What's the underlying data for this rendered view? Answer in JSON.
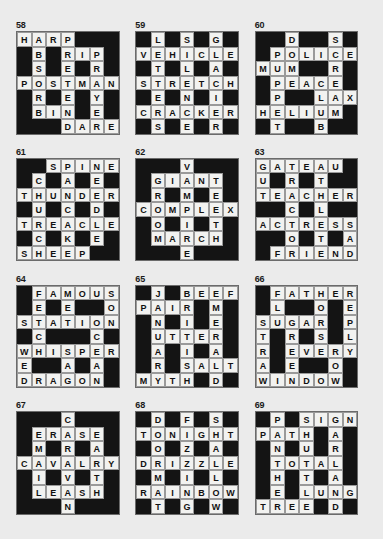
{
  "page": {
    "background_color": "#ebebeb",
    "block_color": "#141414",
    "cell_color": "#f2f2f0",
    "text_color": "#111111",
    "grid_size": 7,
    "puzzle_count": 12
  },
  "puzzles": [
    {
      "number": "58",
      "rows": [
        [
          "H",
          "A",
          "R",
          "P",
          "#",
          "#",
          "#"
        ],
        [
          "#",
          "B",
          "#",
          "R",
          "I",
          "P",
          "#"
        ],
        [
          "#",
          "S",
          "#",
          "E",
          "#",
          "R",
          "#"
        ],
        [
          "P",
          "O",
          "S",
          "T",
          "M",
          "A",
          "N"
        ],
        [
          "#",
          "R",
          "#",
          "E",
          "#",
          "Y",
          "#"
        ],
        [
          "#",
          "B",
          "I",
          "N",
          "#",
          "E",
          "#"
        ],
        [
          "#",
          "#",
          "#",
          "D",
          "A",
          "R",
          "E"
        ]
      ],
      "words": [
        "HARP",
        "RIP",
        "POSTMAN",
        "BIN",
        "DARE",
        "HOSTER",
        "PRETEND",
        "PIRAYE",
        "BSORBINE"
      ]
    },
    {
      "number": "59",
      "rows": [
        [
          "#",
          "L",
          "#",
          "S",
          "#",
          "G",
          "#"
        ],
        [
          "V",
          "E",
          "H",
          "I",
          "C",
          "L",
          "E"
        ],
        [
          "#",
          "T",
          "#",
          "L",
          "#",
          "A",
          "#"
        ],
        [
          "S",
          "T",
          "R",
          "E",
          "T",
          "C",
          "H"
        ],
        [
          "#",
          "E",
          "#",
          "N",
          "#",
          "I",
          "#"
        ],
        [
          "C",
          "R",
          "A",
          "C",
          "K",
          "E",
          "R"
        ],
        [
          "#",
          "S",
          "#",
          "E",
          "#",
          "R",
          "#"
        ]
      ],
      "words": [
        "VEHICLE",
        "STRETCH",
        "CRACKER",
        "LETTERS",
        "SILENCE",
        "GLACIER"
      ]
    },
    {
      "number": "60",
      "rows": [
        [
          "#",
          "#",
          "D",
          "#",
          "#",
          "S",
          "#"
        ],
        [
          "#",
          "P",
          "O",
          "L",
          "I",
          "C",
          "E"
        ],
        [
          "M",
          "U",
          "M",
          "#",
          "#",
          "R",
          "#"
        ],
        [
          "#",
          "P",
          "E",
          "A",
          "C",
          "E",
          "#"
        ],
        [
          "#",
          "P",
          "#",
          "#",
          "L",
          "A",
          "X"
        ],
        [
          "H",
          "E",
          "L",
          "I",
          "U",
          "M",
          "#"
        ],
        [
          "#",
          "T",
          "#",
          "#",
          "B",
          "#",
          "#"
        ]
      ],
      "words": [
        "POLICE",
        "MUM",
        "PEACE",
        "LAX",
        "HELIUM",
        "DOME",
        "PUPPET",
        "SCREAM",
        "CLUB"
      ]
    },
    {
      "number": "61",
      "rows": [
        [
          "#",
          "#",
          "S",
          "P",
          "I",
          "N",
          "E"
        ],
        [
          "#",
          "C",
          "#",
          "A",
          "#",
          "E",
          "#"
        ],
        [
          "T",
          "H",
          "U",
          "N",
          "D",
          "E",
          "R"
        ],
        [
          "#",
          "U",
          "#",
          "C",
          "#",
          "D",
          "#"
        ],
        [
          "T",
          "R",
          "E",
          "A",
          "C",
          "L",
          "E"
        ],
        [
          "#",
          "C",
          "#",
          "K",
          "#",
          "E",
          "#"
        ],
        [
          "S",
          "H",
          "E",
          "E",
          "P",
          "#",
          "#"
        ]
      ],
      "words": [
        "SPINE",
        "THUNDER",
        "TREACLE",
        "SHEEP",
        "CHURCH",
        "SUE",
        "PANCAKE",
        "NEEDLE"
      ]
    },
    {
      "number": "62",
      "rows": [
        [
          "#",
          "#",
          "#",
          "V",
          "#",
          "#",
          "#"
        ],
        [
          "#",
          "G",
          "I",
          "A",
          "N",
          "T",
          "#"
        ],
        [
          "#",
          "R",
          "#",
          "M",
          "#",
          "E",
          "#"
        ],
        [
          "C",
          "O",
          "M",
          "P",
          "L",
          "E",
          "X"
        ],
        [
          "#",
          "O",
          "#",
          "I",
          "#",
          "T",
          "#"
        ],
        [
          "#",
          "M",
          "A",
          "R",
          "C",
          "H",
          "#"
        ],
        [
          "#",
          "#",
          "#",
          "E",
          "#",
          "#",
          "#"
        ]
      ],
      "words": [
        "GIANT",
        "COMPLEX",
        "MARCH",
        "GROOM",
        "VAMPIRE",
        "TEETH"
      ]
    },
    {
      "number": "63",
      "rows": [
        [
          "G",
          "A",
          "T",
          "E",
          "A",
          "U",
          "#"
        ],
        [
          "U",
          "#",
          "R",
          "#",
          "T",
          "#",
          "#"
        ],
        [
          "T",
          "E",
          "A",
          "C",
          "H",
          "E",
          "R"
        ],
        [
          "#",
          "#",
          "C",
          "#",
          "L",
          "#",
          "#"
        ],
        [
          "A",
          "C",
          "T",
          "R",
          "E",
          "S",
          "S"
        ],
        [
          "#",
          "#",
          "O",
          "#",
          "T",
          "#",
          "A"
        ],
        [
          "#",
          "F",
          "R",
          "I",
          "E",
          "N",
          "D"
        ]
      ],
      "words": [
        "GATEAU",
        "TEACHER",
        "ACTRESS",
        "FRIEND",
        "GUT",
        "TRACTOR",
        "ATHLETE",
        "SAD"
      ]
    },
    {
      "number": "64",
      "rows": [
        [
          "#",
          "F",
          "A",
          "M",
          "O",
          "U",
          "S"
        ],
        [
          "#",
          "E",
          "#",
          "E",
          "#",
          "#",
          "O"
        ],
        [
          "S",
          "T",
          "A",
          "T",
          "I",
          "O",
          "N"
        ],
        [
          "#",
          "C",
          "#",
          "#",
          "#",
          "C",
          "#"
        ],
        [
          "W",
          "H",
          "I",
          "S",
          "P",
          "E",
          "R"
        ],
        [
          "E",
          "#",
          "#",
          "A",
          "#",
          "A",
          "#"
        ],
        [
          "D",
          "R",
          "A",
          "G",
          "O",
          "N",
          "#"
        ]
      ],
      "words": [
        "FAMOUS",
        "STATION",
        "WHISPER",
        "DRAGON",
        "FETCH",
        "SWED",
        "SON",
        "OCEAN"
      ]
    },
    {
      "number": "65",
      "rows": [
        [
          "#",
          "J",
          "#",
          "B",
          "E",
          "E",
          "F"
        ],
        [
          "P",
          "A",
          "I",
          "R",
          "#",
          "M",
          "#"
        ],
        [
          "#",
          "N",
          "#",
          "I",
          "#",
          "E",
          "#"
        ],
        [
          "#",
          "U",
          "T",
          "T",
          "E",
          "R",
          "#"
        ],
        [
          "#",
          "A",
          "#",
          "I",
          "#",
          "A",
          "#"
        ],
        [
          "#",
          "R",
          "#",
          "S",
          "A",
          "L",
          "T"
        ],
        [
          "M",
          "Y",
          "T",
          "H",
          "#",
          "D",
          "#"
        ]
      ],
      "words": [
        "BEEF",
        "PAIR",
        "UTTER",
        "SALT",
        "MYTH",
        "JANUARY",
        "BRITISH",
        "EMERALD"
      ]
    },
    {
      "number": "66",
      "rows": [
        [
          "#",
          "F",
          "A",
          "T",
          "H",
          "E",
          "R"
        ],
        [
          "#",
          "L",
          "#",
          "#",
          "O",
          "#",
          "E"
        ],
        [
          "S",
          "U",
          "G",
          "A",
          "R",
          "#",
          "P"
        ],
        [
          "T",
          "#",
          "R",
          "#",
          "S",
          "#",
          "L"
        ],
        [
          "R",
          "#",
          "E",
          "V",
          "E",
          "R",
          "Y"
        ],
        [
          "A",
          "#",
          "E",
          "#",
          "#",
          "O",
          "#"
        ],
        [
          "W",
          "I",
          "N",
          "D",
          "O",
          "W",
          "#"
        ]
      ],
      "words": [
        "FATHER",
        "SUGAR",
        "EVERY",
        "WINDOW",
        "FLU",
        "STRAW",
        "GREEN",
        "HORSE",
        "REPLY"
      ]
    },
    {
      "number": "67",
      "rows": [
        [
          "#",
          "#",
          "#",
          "C",
          "#",
          "#",
          "#"
        ],
        [
          "#",
          "E",
          "R",
          "A",
          "S",
          "E",
          "#"
        ],
        [
          "#",
          "M",
          "#",
          "R",
          "#",
          "A",
          "#"
        ],
        [
          "C",
          "A",
          "V",
          "A",
          "L",
          "R",
          "Y"
        ],
        [
          "#",
          "I",
          "#",
          "V",
          "#",
          "T",
          "#"
        ],
        [
          "#",
          "L",
          "E",
          "A",
          "S",
          "H",
          "#"
        ],
        [
          "#",
          "#",
          "#",
          "N",
          "#",
          "#",
          "#"
        ]
      ],
      "words": [
        "ERASE",
        "CAVALRY",
        "LEASH",
        "EMAIL",
        "CARAVAN",
        "EARTH"
      ]
    },
    {
      "number": "68",
      "rows": [
        [
          "#",
          "D",
          "#",
          "F",
          "#",
          "S",
          "#"
        ],
        [
          "T",
          "O",
          "N",
          "I",
          "G",
          "H",
          "T"
        ],
        [
          "#",
          "O",
          "#",
          "Z",
          "#",
          "A",
          "#"
        ],
        [
          "D",
          "R",
          "I",
          "Z",
          "Z",
          "L",
          "E"
        ],
        [
          "#",
          "M",
          "#",
          "I",
          "#",
          "L",
          "#"
        ],
        [
          "R",
          "A",
          "I",
          "N",
          "B",
          "O",
          "W"
        ],
        [
          "#",
          "T",
          "#",
          "G",
          "#",
          "W",
          "#"
        ]
      ],
      "words": [
        "TONIGHT",
        "DRIZZLE",
        "RAINBOW",
        "DOORMAT",
        "FIZZING",
        "SHALLOW"
      ]
    },
    {
      "number": "69",
      "rows": [
        [
          "#",
          "P",
          "#",
          "S",
          "I",
          "G",
          "N"
        ],
        [
          "P",
          "A",
          "T",
          "H",
          "#",
          "A",
          "#"
        ],
        [
          "#",
          "N",
          "#",
          "U",
          "#",
          "R",
          "#"
        ],
        [
          "#",
          "T",
          "O",
          "T",
          "A",
          "L",
          "#"
        ],
        [
          "#",
          "H",
          "#",
          "T",
          "#",
          "A",
          "#"
        ],
        [
          "#",
          "E",
          "#",
          "L",
          "U",
          "N",
          "G"
        ],
        [
          "T",
          "R",
          "E",
          "E",
          "#",
          "D",
          "#"
        ]
      ],
      "words": [
        "SIGN",
        "PATH",
        "TOTAL",
        "LUNG",
        "TREE",
        "PANTHER",
        "SHUTTLE",
        "GARLAND"
      ]
    }
  ]
}
